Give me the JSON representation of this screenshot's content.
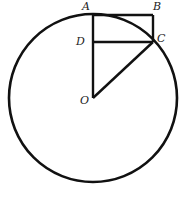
{
  "figure": {
    "type": "geometry",
    "stroke_color": "#111111",
    "background": "#ffffff"
  },
  "points": {
    "A": {
      "label": "A",
      "x": 93,
      "y": 15
    },
    "B": {
      "label": "B",
      "x": 153,
      "y": 15
    },
    "C": {
      "label": "C",
      "x": 153,
      "y": 42
    },
    "D": {
      "label": "D",
      "x": 93,
      "y": 42
    },
    "O": {
      "label": "O",
      "x": 93,
      "y": 98
    }
  },
  "circle": {
    "center": "O",
    "cx": 93,
    "cy": 98,
    "r": 84
  },
  "segments": [
    [
      "A",
      "B"
    ],
    [
      "B",
      "C"
    ],
    [
      "C",
      "D"
    ],
    [
      "A",
      "D"
    ],
    [
      "D",
      "O"
    ],
    [
      "O",
      "C"
    ]
  ],
  "labels": {
    "A": "A",
    "B": "B",
    "C": "C",
    "D": "D",
    "O": "O"
  }
}
